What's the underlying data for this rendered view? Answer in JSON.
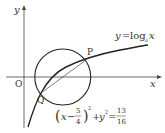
{
  "diagram": {
    "axes": {
      "x_label": "x",
      "y_label": "y",
      "origin_label": "O"
    },
    "points": {
      "P": "P",
      "Q": "Q"
    },
    "curve_label": {
      "lhs": "y",
      "eq": "=",
      "func": "log",
      "base": "a",
      "arg": "x"
    },
    "circle_equation": {
      "open": "(",
      "var": "x",
      "minus": "−",
      "frac_num": "5",
      "frac_den": "4",
      "close": ")",
      "sq": "2",
      "plus": "+",
      "y": "y",
      "ysq": "2",
      "eq": "=",
      "rhs_num": "13",
      "rhs_den": "16"
    },
    "colors": {
      "stroke": "#222222",
      "axis": "#444444"
    }
  }
}
